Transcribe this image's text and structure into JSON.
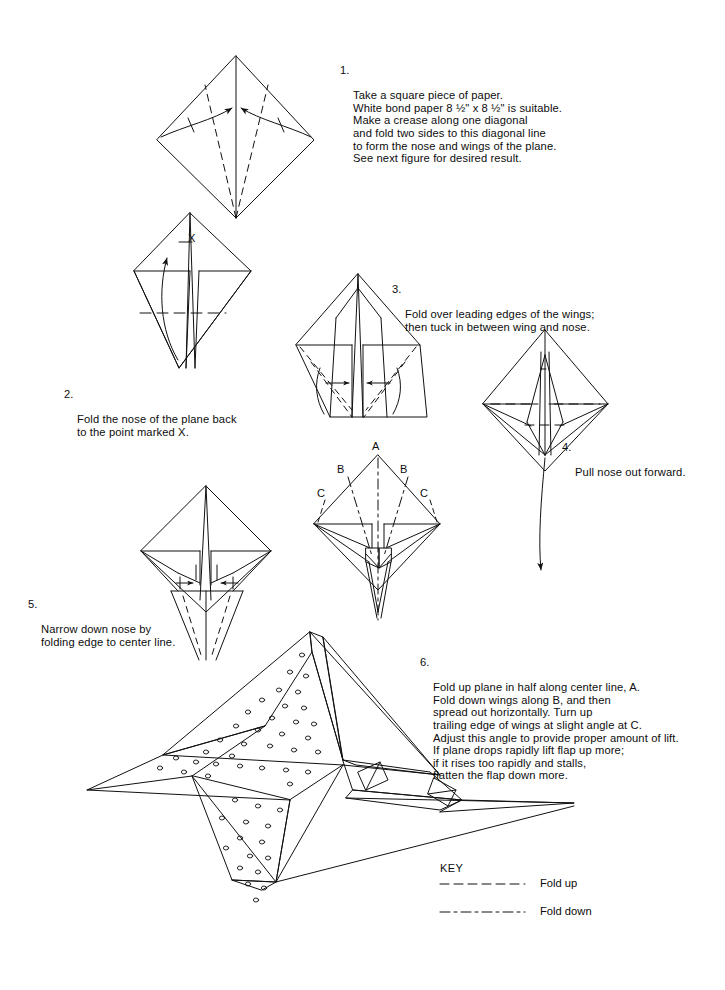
{
  "document": {
    "title": "Paper Airplane Folding Instructions",
    "background_color": "#ffffff",
    "ink_color": "#111111"
  },
  "steps": [
    {
      "number": "1.",
      "text": "Take a square piece of paper.\nWhite bond paper 8 ½\" x 8 ½\" is suitable.\nMake a crease along one diagonal\nand fold two sides to this diagonal line\nto form the nose and wings of the plane.\nSee next figure for desired result.",
      "x": 340,
      "y": 64
    },
    {
      "number": "2.",
      "text": "Fold the nose of the plane back\nto the point marked X.",
      "x": 64,
      "y": 388
    },
    {
      "number": "3.",
      "text": "Fold over leading edges of the wings;\nthen tuck in between wing and nose.",
      "x": 392,
      "y": 283
    },
    {
      "number": "4.",
      "text": "Pull nose out forward.",
      "x": 562,
      "y": 441
    },
    {
      "number": "5.",
      "text": "Narrow down nose by\nfolding edge to center line.",
      "x": 28,
      "y": 598
    },
    {
      "number": "6.",
      "text": "Fold up plane in half along center line, A.\nFold down wings along B, and then\nspread out horizontally. Turn up\ntrailing edge of wings at slight angle at C.\nAdjust this angle to provide proper amount of lift.\nIf plane drops rapidly lift flap up more;\nif it rises too rapidly and stalls,\nflatten the flap down more.",
      "x": 420,
      "y": 656
    }
  ],
  "figure_labels": [
    {
      "name": "label-x-fig2",
      "text": "X",
      "x": 188,
      "y": 232
    },
    {
      "name": "label-a-fig6",
      "text": "A",
      "x": 372,
      "y": 440
    },
    {
      "name": "label-b-left-fig6",
      "text": "B",
      "x": 337,
      "y": 463
    },
    {
      "name": "label-b-right-fig6",
      "text": "B",
      "x": 400,
      "y": 463
    },
    {
      "name": "label-c-left-fig6",
      "text": "C",
      "x": 317,
      "y": 487
    },
    {
      "name": "label-c-right-fig6",
      "text": "C",
      "x": 420,
      "y": 487
    }
  ],
  "key": {
    "title": "KEY",
    "title_x": 440,
    "title_y": 862,
    "entries": [
      {
        "name": "fold-up",
        "label": "Fold up",
        "label_x": 540,
        "label_y": 877,
        "line_y": 884,
        "line_x1": 440,
        "line_x2": 525,
        "dash": "9,5"
      },
      {
        "name": "fold-down",
        "label": "Fold down",
        "label_x": 540,
        "label_y": 905,
        "line_y": 912,
        "line_x1": 440,
        "line_x2": 525,
        "dash": "10,4,3,4"
      }
    ]
  },
  "figures": [
    {
      "name": "figure-1-square-diagonal-fold",
      "step": 1
    },
    {
      "name": "figure-2-kite-nose-fold-back",
      "step": 2
    },
    {
      "name": "figure-3-leading-edge-fold",
      "step": 3
    },
    {
      "name": "figure-4-pull-nose-forward",
      "step": 4
    },
    {
      "name": "figure-5-narrow-nose",
      "step": 5
    },
    {
      "name": "figure-6-abc-fold-lines",
      "step": 6
    },
    {
      "name": "figure-7-finished-plane-perspective",
      "step": 6
    }
  ]
}
